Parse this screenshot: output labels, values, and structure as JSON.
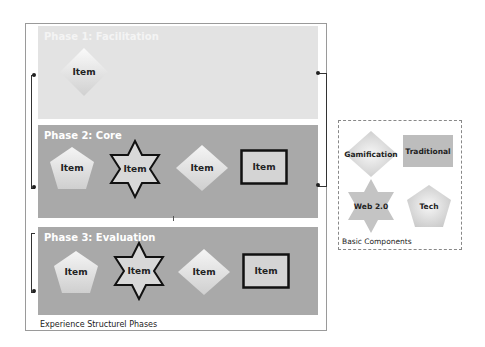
{
  "diagram": {
    "outer_label": "Experience Structurel Phases",
    "phases": [
      {
        "title": "Phase 1: Facilitation",
        "items": [
          {
            "shape": "diamond",
            "label": "Item"
          }
        ]
      },
      {
        "title": "Phase 2: Core",
        "items": [
          {
            "shape": "pentagon",
            "label": "Item"
          },
          {
            "shape": "star6",
            "label": "Item"
          },
          {
            "shape": "diamond",
            "label": "Item"
          },
          {
            "shape": "rectangle",
            "label": "Item"
          }
        ]
      },
      {
        "title": "Phase 3: Evaluation",
        "items": [
          {
            "shape": "pentagon",
            "label": "Item"
          },
          {
            "shape": "star6",
            "label": "Item"
          },
          {
            "shape": "diamond",
            "label": "Item"
          },
          {
            "shape": "rectangle",
            "label": "Item"
          }
        ]
      }
    ],
    "basic_components": {
      "label": "Basic Components",
      "items": [
        {
          "shape": "diamond",
          "label": "Gamification"
        },
        {
          "shape": "rectangle",
          "label": "Traditional"
        },
        {
          "shape": "star6",
          "label": "Web 2.0"
        },
        {
          "shape": "pentagon",
          "label": "Tech"
        }
      ]
    }
  },
  "colors": {
    "phase1_bg": "#e3e3e3",
    "phase_bg": "#a9a9a9",
    "shape_fill": "#e6e6e6",
    "outline": "#111111"
  }
}
